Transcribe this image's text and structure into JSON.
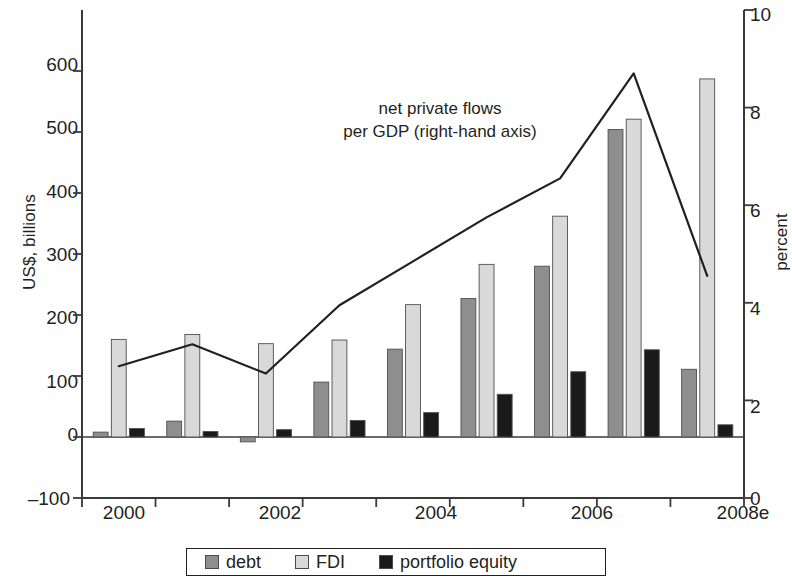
{
  "chart_data": {
    "type": "bar",
    "title": "",
    "subtitle": "",
    "xlabel": "",
    "ylabel": "US$, billions",
    "y2label": "percent",
    "categories": [
      "2000",
      "2001",
      "2002",
      "2003",
      "2004",
      "2005",
      "2006",
      "2007",
      "2008e"
    ],
    "ylim": [
      -100,
      700
    ],
    "yticks": [
      -100,
      0,
      100,
      200,
      300,
      400,
      500,
      600
    ],
    "ytick_labels": [
      "–100",
      "0",
      "100",
      "200",
      "300",
      "400",
      "500",
      "600"
    ],
    "y2lim": [
      0,
      10
    ],
    "y2ticks": [
      0,
      2,
      4,
      6,
      8,
      10
    ],
    "y2tick_labels": [
      "0",
      "2",
      "4",
      "6",
      "8",
      "10"
    ],
    "grid": false,
    "legend_position": "bottom",
    "series": [
      {
        "name": "debt",
        "type": "bar",
        "axis": "left",
        "color": "#8e8e8e",
        "values": [
          8,
          26,
          -8,
          90,
          144,
          227,
          280,
          504,
          111
        ]
      },
      {
        "name": "FDI",
        "type": "bar",
        "axis": "left",
        "color": "#d9d9d9",
        "values": [
          160,
          168,
          153,
          159,
          217,
          283,
          362,
          521,
          587
        ]
      },
      {
        "name": "portfolio equity",
        "type": "bar",
        "axis": "left",
        "color": "#1a1a1a",
        "values": [
          14,
          9,
          12,
          27,
          40,
          70,
          107,
          143,
          20
        ]
      },
      {
        "name": "net private flows per GDP (right-hand axis)",
        "type": "line",
        "axis": "right",
        "color": "#231f20",
        "values": [
          2.7,
          3.15,
          2.55,
          3.95,
          4.85,
          5.75,
          6.55,
          8.7,
          4.55
        ]
      }
    ],
    "annotations": [
      {
        "name": "line-series-annotation",
        "line1": "net private flows",
        "line2": "per GDP (right-hand axis)"
      }
    ]
  },
  "legend": {
    "items": [
      {
        "label": "debt",
        "color": "#8e8e8e"
      },
      {
        "label": "FDI",
        "color": "#d9d9d9"
      },
      {
        "label": "portfolio equity",
        "color": "#1a1a1a"
      }
    ]
  }
}
